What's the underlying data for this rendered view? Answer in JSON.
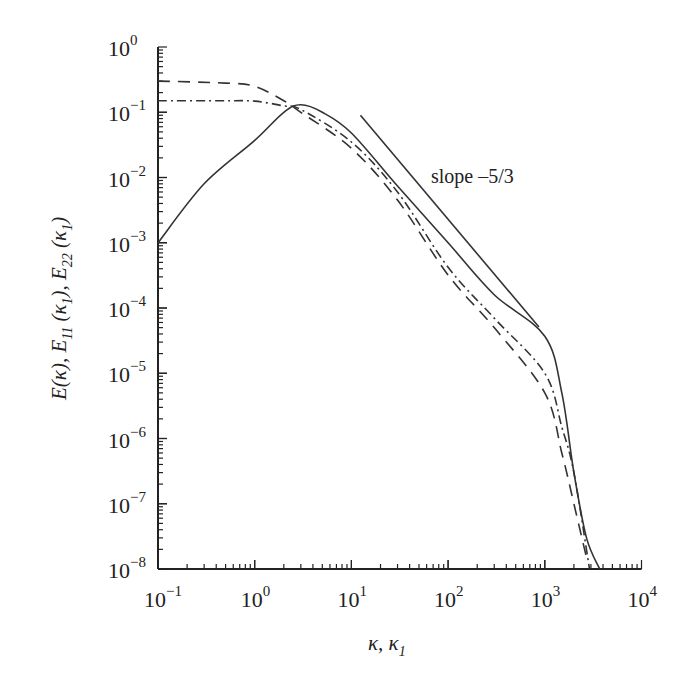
{
  "chart_data": {
    "type": "line",
    "title": "",
    "xlabel": "κ, κ₁",
    "ylabel": "E(κ), E₁₁(κ₁), E₂₂(κ₁)",
    "xscale": "log",
    "yscale": "log",
    "xlim": [
      0.1,
      10000
    ],
    "ylim": [
      1e-08,
      1
    ],
    "grid": false,
    "legend": null,
    "x_ticks": [
      {
        "base": "10",
        "exp": "−1",
        "value": 0.1
      },
      {
        "base": "10",
        "exp": "0",
        "value": 1
      },
      {
        "base": "10",
        "exp": "1",
        "value": 10
      },
      {
        "base": "10",
        "exp": "2",
        "value": 100
      },
      {
        "base": "10",
        "exp": "3",
        "value": 1000
      },
      {
        "base": "10",
        "exp": "4",
        "value": 10000
      }
    ],
    "y_ticks": [
      {
        "base": "10",
        "exp": "0",
        "value": 1
      },
      {
        "base": "10",
        "exp": "−1",
        "value": 0.1
      },
      {
        "base": "10",
        "exp": "−2",
        "value": 0.01
      },
      {
        "base": "10",
        "exp": "−3",
        "value": 0.001
      },
      {
        "base": "10",
        "exp": "−4",
        "value": 0.0001
      },
      {
        "base": "10",
        "exp": "−5",
        "value": 1e-05
      },
      {
        "base": "10",
        "exp": "−6",
        "value": 1e-06
      },
      {
        "base": "10",
        "exp": "−7",
        "value": 1e-07
      },
      {
        "base": "10",
        "exp": "−8",
        "value": 1e-08
      }
    ],
    "series": [
      {
        "name": "E(κ)",
        "style": "solid",
        "x": [
          0.1,
          0.3,
          1,
          2,
          3,
          5,
          10,
          30,
          100,
          300,
          1000,
          1500,
          2000,
          2700,
          3700
        ],
        "y": [
          0.001,
          0.008,
          0.037,
          0.1,
          0.13,
          0.1,
          0.048,
          0.0074,
          0.001,
          0.00016,
          3.7e-05,
          5e-06,
          3e-07,
          3e-08,
          1e-08
        ]
      },
      {
        "name": "E11(κ1)",
        "style": "dashed",
        "x": [
          0.1,
          0.5,
          1,
          2,
          3,
          10,
          30,
          100,
          300,
          1000,
          1500,
          2000,
          2700
        ],
        "y": [
          0.3,
          0.28,
          0.25,
          0.15,
          0.1,
          0.028,
          0.0045,
          0.00032,
          5e-05,
          5e-06,
          6e-07,
          1e-07,
          1.5e-08
        ]
      },
      {
        "name": "E22(κ1)",
        "style": "dash-dot",
        "x": [
          0.1,
          0.5,
          1,
          2,
          3,
          10,
          30,
          100,
          300,
          1000,
          1500,
          2000,
          2900
        ],
        "y": [
          0.15,
          0.15,
          0.148,
          0.125,
          0.11,
          0.035,
          0.006,
          0.00042,
          7e-05,
          1e-05,
          1.5e-06,
          3e-07,
          1e-08
        ]
      }
    ],
    "reference_line": {
      "label": "slope –5/3",
      "slope": -1.6667,
      "x": [
        12.4,
        870
      ],
      "y": [
        0.09,
        5.1e-05
      ]
    },
    "annotations": [
      {
        "text": "slope –5/3",
        "x": 150,
        "y": 0.02
      }
    ]
  },
  "labels": {
    "annotation": "slope –5/3",
    "xlabel_main": "κ, κ",
    "xlabel_sub": "1",
    "ylabel_parts": {
      "e1": "E(κ), E",
      "s1": "11",
      "e2": " (κ",
      "s2": "1",
      "e3": "), E",
      "s3": "22",
      "e4": " (κ",
      "s4": "1",
      "e5": ")"
    }
  }
}
